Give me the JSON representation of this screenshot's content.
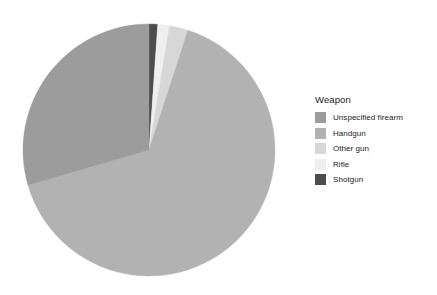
{
  "chart_data": {
    "type": "pie",
    "title": "",
    "legend_title": "Weapon",
    "legend_position": "right",
    "grid": false,
    "categories": [
      "Unspecified firearm",
      "Handgun",
      "Other gun",
      "Rifle",
      "Shotgun"
    ],
    "values": [
      29.5,
      65.5,
      2.4,
      1.5,
      1.1
    ],
    "value_unit": "percent",
    "colors": [
      "#9c9c9c",
      "#b2b2b2",
      "#d7d7d7",
      "#efefef",
      "#4c4c4c"
    ],
    "slices": [
      {
        "label": "Shotgun",
        "value": 1.1,
        "color": "#4c4c4c",
        "start_deg": 0.0,
        "end_deg": 4.0
      },
      {
        "label": "Rifle",
        "value": 1.5,
        "color": "#efefef",
        "start_deg": 4.0,
        "end_deg": 9.4
      },
      {
        "label": "Other gun",
        "value": 2.4,
        "color": "#d7d7d7",
        "start_deg": 9.4,
        "end_deg": 18.0
      },
      {
        "label": "Handgun",
        "value": 65.5,
        "color": "#b2b2b2",
        "start_deg": 18.0,
        "end_deg": 253.8
      },
      {
        "label": "Unspecified firearm",
        "value": 29.5,
        "color": "#9c9c9c",
        "start_deg": 253.8,
        "end_deg": 360.0
      }
    ],
    "geometry": {
      "cx": 149,
      "cy": 150,
      "r": 126
    }
  },
  "legend": {
    "title": "Weapon",
    "items": [
      {
        "label": "Unspecified firearm",
        "color": "#9c9c9c"
      },
      {
        "label": "Handgun",
        "color": "#b2b2b2"
      },
      {
        "label": "Other gun",
        "color": "#d7d7d7"
      },
      {
        "label": "Rifle",
        "color": "#efefef"
      },
      {
        "label": "Shotgun",
        "color": "#4c4c4c"
      }
    ]
  }
}
